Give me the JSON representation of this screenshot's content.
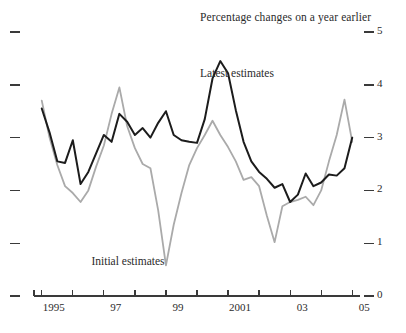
{
  "chart_data": {
    "type": "line",
    "title": "Percentage changes on a year earlier",
    "xlabel": "",
    "ylabel": "",
    "ylim": [
      0,
      5
    ],
    "xlim": [
      1994.75,
      2005.25
    ],
    "grid": false,
    "legend_position": "inline-annotation",
    "y_ticks": [
      "0",
      "1",
      "2",
      "3",
      "4",
      "5"
    ],
    "y_tick_values": [
      0,
      1,
      2,
      3,
      4,
      5
    ],
    "x_ticks": [
      "1995",
      "97",
      "99",
      "2001",
      "03",
      "05"
    ],
    "x_tick_values": [
      1995,
      1997,
      1999,
      2001,
      2003,
      2005
    ],
    "x_minor_tick_values": [
      1996,
      1998,
      2000,
      2002,
      2004
    ],
    "annotations": [
      {
        "text": "Latest estimates",
        "x": 2000.1,
        "y": 4.18
      },
      {
        "text": "Initial estimates",
        "x": 1996.6,
        "y": 0.62
      }
    ],
    "series": [
      {
        "name": "Latest estimates",
        "color": "#1c1c1c",
        "width": 2.0,
        "x": [
          1995.0,
          1995.25,
          1995.5,
          1995.75,
          1996.0,
          1996.25,
          1996.5,
          1996.75,
          1997.0,
          1997.25,
          1997.5,
          1997.75,
          1998.0,
          1998.25,
          1998.5,
          1998.75,
          1999.0,
          1999.25,
          1999.5,
          1999.75,
          2000.0,
          2000.25,
          2000.5,
          2000.75,
          2001.0,
          2001.25,
          2001.5,
          2001.75,
          2002.0,
          2002.25,
          2002.5,
          2002.75,
          2003.0,
          2003.25,
          2003.5,
          2003.75,
          2004.0,
          2004.25,
          2004.5,
          2004.75,
          2005.0
        ],
        "y": [
          3.55,
          3.1,
          2.55,
          2.52,
          2.95,
          2.12,
          2.35,
          2.7,
          3.05,
          2.92,
          3.45,
          3.3,
          3.05,
          3.18,
          3.0,
          3.28,
          3.5,
          3.05,
          2.95,
          2.92,
          2.9,
          3.35,
          4.12,
          4.45,
          4.22,
          3.52,
          2.92,
          2.55,
          2.35,
          2.22,
          2.05,
          2.12,
          1.78,
          1.92,
          2.32,
          2.08,
          2.15,
          2.3,
          2.28,
          2.42,
          3.0
        ]
      },
      {
        "name": "Initial estimates",
        "color": "#aaaaaa",
        "width": 1.8,
        "x": [
          1995.0,
          1995.25,
          1995.5,
          1995.75,
          1996.0,
          1996.25,
          1996.5,
          1996.75,
          1997.0,
          1997.25,
          1997.5,
          1997.75,
          1998.0,
          1998.25,
          1998.5,
          1998.75,
          1999.0,
          1999.25,
          1999.5,
          1999.75,
          2000.0,
          2000.25,
          2000.5,
          2000.75,
          2001.0,
          2001.25,
          2001.5,
          2001.75,
          2002.0,
          2002.25,
          2002.5,
          2002.75,
          2003.0,
          2003.25,
          2003.5,
          2003.75,
          2004.0,
          2004.25,
          2004.5,
          2004.75,
          2005.0
        ],
        "y": [
          3.7,
          3.0,
          2.48,
          2.08,
          1.95,
          1.78,
          2.0,
          2.45,
          2.85,
          3.45,
          3.95,
          3.22,
          2.8,
          2.5,
          2.42,
          1.62,
          0.58,
          1.35,
          1.95,
          2.48,
          2.8,
          3.05,
          3.32,
          3.05,
          2.82,
          2.55,
          2.2,
          2.25,
          2.08,
          1.52,
          1.02,
          1.7,
          1.78,
          1.82,
          1.88,
          1.72,
          2.0,
          2.55,
          3.05,
          3.72,
          2.92
        ]
      }
    ]
  },
  "chart": {
    "background_color": "#ffffff",
    "axis_color": "#3a3a3a",
    "latest_color": "#1c1c1c",
    "initial_color": "#aaaaaa",
    "left_axis_ticks_unlabeled": true
  }
}
